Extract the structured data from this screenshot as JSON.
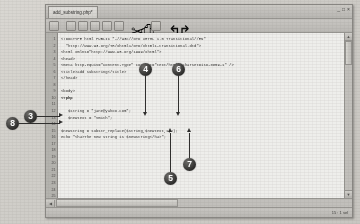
{
  "window": {
    "tab_label": "add_substring.php*",
    "minimize_glyph": "_",
    "maximize_glyph": "□",
    "close_glyph": "×"
  },
  "toolbar": {
    "icons": [
      "new-file-icon",
      "open-folder-icon",
      "save-icon",
      "save-all-icon",
      "print-icon",
      "print-preview-icon",
      "cut-icon",
      "copy-icon",
      "paste-icon",
      "undo-icon",
      "redo-icon"
    ]
  },
  "gutter": {
    "line_numbers": [
      "1",
      "2",
      "3",
      "4",
      "5",
      "6",
      "7",
      "8",
      "9",
      "10",
      "11",
      "12",
      "13",
      "14",
      "15",
      "16",
      "17",
      "18",
      "19",
      "20",
      "21",
      "22",
      "23",
      "24",
      "25"
    ]
  },
  "code": {
    "lines": [
      "<!DOCTYPE html PUBLIC \"-//W3C//DTD XHTML 1.0 Transitional//EN\"",
      "  \"http://www.w3.org/TR/xhtml1/DTD/xhtml1-transitional.dtd\">",
      "<html xmlns=\"http://www.w3.org/1999/xhtml\">",
      "<head>",
      "<meta http-equiv=\"Content-Type\" content=\"text/html; charset=iso-8859-1\" />",
      "<title>add substring</title>",
      "</head>",
      "",
      "<body>",
      "<?php",
      "",
      "   $string = \"jane@yahoo.com\";",
      "   $newtext = \"Smith\";",
      "",
      "$newstring = substr_replace($string,$newtext,1,2);",
      "echo \"<h4>The new string is $newstring</h4>\";",
      "",
      "",
      "",
      "",
      "",
      "",
      "",
      "",
      ""
    ],
    "bold_line_indices": [
      9
    ]
  },
  "statusbar": {
    "position": "15 : 1 sel"
  },
  "scrollbars": {
    "up_glyph": "▲",
    "down_glyph": "▼",
    "left_glyph": "◀",
    "right_glyph": "▶"
  },
  "callouts": [
    {
      "label": "4",
      "direction": "down"
    },
    {
      "label": "6",
      "direction": "down"
    },
    {
      "label": "5",
      "direction": "up"
    },
    {
      "label": "7",
      "direction": "up"
    },
    {
      "label": "3",
      "direction": "right"
    },
    {
      "label": "8",
      "direction": "right"
    }
  ]
}
